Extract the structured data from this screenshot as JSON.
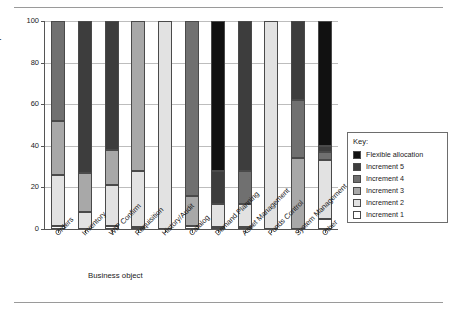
{
  "chart_data": {
    "type": "bar",
    "subtype": "stacked-bar",
    "title": "",
    "xlabel": "Business object",
    "ylabel": "Percent complete",
    "ylim": [
      0,
      100
    ],
    "yticks": [
      0,
      20,
      40,
      60,
      80,
      100
    ],
    "grid": true,
    "legend_position": "right",
    "legend_title": "Key:",
    "categories": [
      "Orders",
      "Inventory",
      "WIP Confirm",
      "Requisition",
      "History/Audit",
      "Catalog",
      "Demand Planning",
      "Asset Management",
      "Funds Control",
      "System Management",
      "Other"
    ],
    "series": [
      {
        "name": "Increment 1",
        "color": "#ffffff",
        "values": [
          1.5,
          0,
          1.5,
          1,
          0,
          1.5,
          1,
          1,
          0,
          0,
          5
        ]
      },
      {
        "name": "Increment 2",
        "color": "#e2e2e2",
        "values": [
          24.5,
          8,
          19.5,
          27,
          100,
          0,
          11,
          11,
          100,
          0,
          28
        ]
      },
      {
        "name": "Increment 3",
        "color": "#a8a8a8",
        "values": [
          26,
          19,
          17,
          72,
          0,
          14.5,
          0,
          0,
          0,
          34,
          0
        ]
      },
      {
        "name": "Increment 4",
        "color": "#707070",
        "values": [
          48,
          0,
          0,
          0,
          0,
          84,
          0,
          16,
          0,
          28,
          4
        ]
      },
      {
        "name": "Increment 5",
        "color": "#3d3d3d",
        "values": [
          0,
          73,
          62,
          0,
          0,
          0,
          16,
          72,
          0,
          38,
          3
        ]
      },
      {
        "name": "Flexible allocation",
        "color": "#111111",
        "values": [
          0,
          0,
          0,
          0,
          0,
          0,
          72,
          0,
          0,
          0,
          60
        ]
      }
    ]
  }
}
